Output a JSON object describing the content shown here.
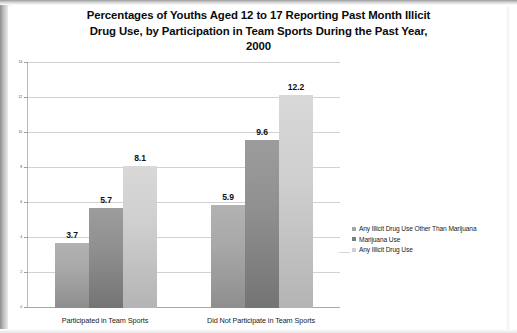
{
  "chart_data": {
    "type": "bar",
    "title": "Percentages of Youths Aged 12 to 17 Reporting Past Month Illicit Drug Use, by Participation in Team Sports During the Past Year, 2000",
    "title_lines": [
      "Percentages of Youths Aged 12 to 17 Reporting Past Month Illicit",
      "Drug Use, by Participation in Team Sports During the Past Year,",
      "2000"
    ],
    "categories": [
      "Participated in Team Sports",
      "Did Not Participate in Team Sports"
    ],
    "series": [
      {
        "name": "Any Illicit Drug Use Other Than Marijuana",
        "values": [
          3.7,
          5.9
        ],
        "color": "#a5a5a5"
      },
      {
        "name": "Marijuana Use",
        "values": [
          5.7,
          9.6
        ],
        "color": "#7d7d7d"
      },
      {
        "name": "Any Illicit Drug Use",
        "values": [
          8.1,
          12.2
        ],
        "color": "#d0d0d0"
      }
    ],
    "xlabel": "",
    "ylabel": "",
    "ylim": [
      0,
      14
    ],
    "yticks": [
      0,
      2,
      4,
      6,
      8,
      10,
      12,
      14
    ],
    "ytick_labels": [
      "0",
      "2",
      "4",
      "6",
      "8",
      "10",
      "12",
      "14"
    ],
    "grid": true,
    "legend_position": "right",
    "value_labels": [
      "3.7",
      "5.7",
      "8.1",
      "5.9",
      "9.6",
      "12.2"
    ]
  }
}
